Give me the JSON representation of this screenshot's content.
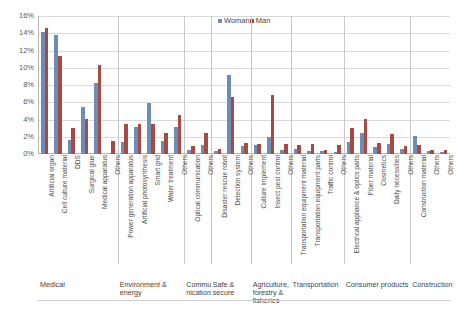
{
  "chart_data": {
    "type": "bar",
    "title": "",
    "subtitle": "",
    "xlabel": "",
    "ylabel": "",
    "ylim": [
      0,
      16
    ],
    "ytick_labels": [
      "16%",
      "14%",
      "12%",
      "10%",
      "8%",
      "6%",
      "4%",
      "2%",
      "0%"
    ],
    "ytick_values": [
      16,
      14,
      12,
      10,
      8,
      6,
      4,
      2,
      0
    ],
    "grid": true,
    "legend_position": "top-center",
    "unit": "%",
    "categories": [
      "Artificial organ",
      "Cell culture material",
      "DDS",
      "Surgical glue",
      "Medical apparatus",
      "Others",
      "Power generation apparatus",
      "Artificial photosynthesis",
      "Smart grid",
      "Water treatment",
      "Others",
      "Optical communication",
      "Others",
      "Disaster rescue robot",
      "Detection system",
      "Others",
      "Culture implement",
      "Insect pest control",
      "Others",
      "Transportation equipment material",
      "Transportation equipment parts",
      "Traffic control",
      "Others",
      "Electrical appliance & optics parts",
      "Fiber material",
      "Cosmetics",
      "Daily necessities",
      "Others",
      "Construction material",
      "Others",
      "Others"
    ],
    "series": [
      {
        "name": "Woman",
        "color": "#6f8cb5",
        "values": [
          14.2,
          13.8,
          1.6,
          5.4,
          8.2,
          0.0,
          1.4,
          3.1,
          5.9,
          1.5,
          3.1,
          0.5,
          1.0,
          0.4,
          9.2,
          0.9,
          1.1,
          2.0,
          0.5,
          0.6,
          0.4,
          0.3,
          0.2,
          1.4,
          2.4,
          0.8,
          1.2,
          0.6,
          2.1,
          0.3,
          0.2
        ]
      },
      {
        "name": "Man",
        "color": "#a54b41",
        "values": [
          14.6,
          11.4,
          3.0,
          4.1,
          10.3,
          1.5,
          3.5,
          3.5,
          3.5,
          2.4,
          4.5,
          0.9,
          2.4,
          0.6,
          6.6,
          1.3,
          1.2,
          6.9,
          1.2,
          1.1,
          1.2,
          0.5,
          1.0,
          3.0,
          4.1,
          1.3,
          2.3,
          0.9,
          1.1,
          0.5,
          0.5
        ]
      }
    ],
    "groups": [
      {
        "label": "Medical",
        "count": 6
      },
      {
        "label": "Environment & energy",
        "count": 5
      },
      {
        "label": "Commu nication",
        "count": 2
      },
      {
        "label": "Safe & secure",
        "count": 3
      },
      {
        "label": "Agriculture, forestry & fisheries",
        "count": 3
      },
      {
        "label": "Transportation",
        "count": 4
      },
      {
        "label": "Consumer products",
        "count": 5
      },
      {
        "label": "Construction",
        "count": 3
      }
    ]
  },
  "legend": {
    "items": [
      {
        "label": "Woman",
        "color": "#6f8cb5"
      },
      {
        "label": "Man",
        "color": "#a54b41"
      }
    ]
  }
}
